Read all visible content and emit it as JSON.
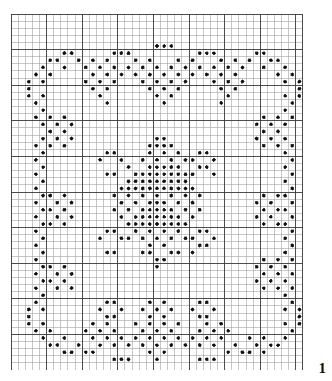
{
  "page": {
    "page_number": "1",
    "background_color": "#ffffff"
  },
  "chart_data": {
    "type": "heatmap",
    "title": "",
    "subtitle": "",
    "xlabel": "",
    "ylabel": "",
    "notation": "filet-crochet-chart",
    "grid": {
      "columns": 41,
      "rows": 50,
      "cell_size_px": 7.12,
      "major_line_every": 5,
      "grid_on": true,
      "minor_line_color": "#9a9a9a",
      "major_line_color": "#3a3a3a",
      "cell_fill_color": "#ffffff",
      "dot_color": "#111111",
      "dot_radius_px": 1.7,
      "dot_outline_color": "#555555"
    },
    "legend": {
      "position": "none",
      "entries": [
        {
          "symbol": "dot",
          "label": "filled block"
        },
        {
          "symbol": "empty",
          "label": "open mesh"
        }
      ]
    },
    "xlim": [
      0,
      41
    ],
    "ylim": [
      0,
      50
    ],
    "x": [
      0,
      1,
      2,
      3,
      4,
      5,
      6,
      7,
      8,
      9,
      10,
      11,
      12,
      13,
      14,
      15,
      16,
      17,
      18,
      19,
      20,
      21,
      22,
      23,
      24,
      25,
      26,
      27,
      28,
      29,
      30,
      31,
      32,
      33,
      34,
      35,
      36,
      37,
      38,
      39,
      40
    ],
    "filled_cells": [
      [
        20,
        4
      ],
      [
        21,
        4
      ],
      [
        22,
        4
      ],
      [
        14,
        5
      ],
      [
        15,
        5
      ],
      [
        16,
        5
      ],
      [
        26,
        5
      ],
      [
        27,
        5
      ],
      [
        28,
        5
      ],
      [
        7,
        5
      ],
      [
        8,
        5
      ],
      [
        34,
        5
      ],
      [
        35,
        5
      ],
      [
        5,
        6
      ],
      [
        6,
        6
      ],
      [
        9,
        6
      ],
      [
        11,
        6
      ],
      [
        13,
        6
      ],
      [
        17,
        6
      ],
      [
        19,
        6
      ],
      [
        23,
        6
      ],
      [
        25,
        6
      ],
      [
        29,
        6
      ],
      [
        31,
        6
      ],
      [
        33,
        6
      ],
      [
        36,
        6
      ],
      [
        37,
        6
      ],
      [
        4,
        7
      ],
      [
        7,
        7
      ],
      [
        10,
        7
      ],
      [
        12,
        7
      ],
      [
        14,
        7
      ],
      [
        16,
        7
      ],
      [
        18,
        7
      ],
      [
        20,
        7
      ],
      [
        22,
        7
      ],
      [
        24,
        7
      ],
      [
        26,
        7
      ],
      [
        28,
        7
      ],
      [
        30,
        7
      ],
      [
        32,
        7
      ],
      [
        35,
        7
      ],
      [
        38,
        7
      ],
      [
        3,
        8
      ],
      [
        5,
        8
      ],
      [
        11,
        8
      ],
      [
        13,
        8
      ],
      [
        15,
        8
      ],
      [
        17,
        8
      ],
      [
        19,
        8
      ],
      [
        21,
        8
      ],
      [
        23,
        8
      ],
      [
        25,
        8
      ],
      [
        27,
        8
      ],
      [
        29,
        8
      ],
      [
        31,
        8
      ],
      [
        37,
        8
      ],
      [
        39,
        8
      ],
      [
        2,
        9
      ],
      [
        4,
        9
      ],
      [
        10,
        9
      ],
      [
        12,
        9
      ],
      [
        14,
        9
      ],
      [
        18,
        9
      ],
      [
        20,
        9
      ],
      [
        22,
        9
      ],
      [
        24,
        9
      ],
      [
        28,
        9
      ],
      [
        30,
        9
      ],
      [
        32,
        9
      ],
      [
        38,
        9
      ],
      [
        40,
        9
      ],
      [
        2,
        10
      ],
      [
        11,
        10
      ],
      [
        13,
        10
      ],
      [
        19,
        10
      ],
      [
        21,
        10
      ],
      [
        23,
        10
      ],
      [
        29,
        10
      ],
      [
        31,
        10
      ],
      [
        40,
        10
      ],
      [
        2,
        11
      ],
      [
        4,
        11
      ],
      [
        12,
        11
      ],
      [
        20,
        11
      ],
      [
        22,
        11
      ],
      [
        30,
        11
      ],
      [
        38,
        11
      ],
      [
        40,
        11
      ],
      [
        3,
        12
      ],
      [
        13,
        12
      ],
      [
        21,
        12
      ],
      [
        29,
        12
      ],
      [
        39,
        12
      ],
      [
        4,
        13
      ],
      [
        38,
        13
      ],
      [
        3,
        14
      ],
      [
        5,
        14
      ],
      [
        7,
        14
      ],
      [
        35,
        14
      ],
      [
        37,
        14
      ],
      [
        39,
        14
      ],
      [
        4,
        15
      ],
      [
        6,
        15
      ],
      [
        8,
        15
      ],
      [
        34,
        15
      ],
      [
        36,
        15
      ],
      [
        38,
        15
      ],
      [
        5,
        16
      ],
      [
        7,
        16
      ],
      [
        35,
        16
      ],
      [
        37,
        16
      ],
      [
        4,
        17
      ],
      [
        6,
        17
      ],
      [
        8,
        17
      ],
      [
        20,
        17
      ],
      [
        21,
        17
      ],
      [
        34,
        17
      ],
      [
        36,
        17
      ],
      [
        38,
        17
      ],
      [
        3,
        18
      ],
      [
        5,
        18
      ],
      [
        7,
        18
      ],
      [
        19,
        18
      ],
      [
        20,
        18
      ],
      [
        21,
        18
      ],
      [
        22,
        18
      ],
      [
        35,
        18
      ],
      [
        37,
        18
      ],
      [
        39,
        18
      ],
      [
        4,
        19
      ],
      [
        13,
        19
      ],
      [
        14,
        19
      ],
      [
        19,
        19
      ],
      [
        21,
        19
      ],
      [
        23,
        19
      ],
      [
        26,
        19
      ],
      [
        27,
        19
      ],
      [
        38,
        19
      ],
      [
        3,
        20
      ],
      [
        12,
        20
      ],
      [
        15,
        20
      ],
      [
        18,
        20
      ],
      [
        20,
        20
      ],
      [
        22,
        20
      ],
      [
        24,
        20
      ],
      [
        25,
        20
      ],
      [
        28,
        20
      ],
      [
        39,
        20
      ],
      [
        4,
        21
      ],
      [
        16,
        21
      ],
      [
        19,
        21
      ],
      [
        20,
        21
      ],
      [
        21,
        21
      ],
      [
        22,
        21
      ],
      [
        23,
        21
      ],
      [
        26,
        21
      ],
      [
        27,
        21
      ],
      [
        38,
        21
      ],
      [
        3,
        22
      ],
      [
        13,
        22
      ],
      [
        14,
        22
      ],
      [
        17,
        22
      ],
      [
        18,
        22
      ],
      [
        19,
        22
      ],
      [
        20,
        22
      ],
      [
        21,
        22
      ],
      [
        22,
        22
      ],
      [
        23,
        22
      ],
      [
        24,
        22
      ],
      [
        25,
        22
      ],
      [
        28,
        22
      ],
      [
        39,
        22
      ],
      [
        4,
        23
      ],
      [
        16,
        23
      ],
      [
        17,
        23
      ],
      [
        18,
        23
      ],
      [
        19,
        23
      ],
      [
        20,
        23
      ],
      [
        21,
        23
      ],
      [
        22,
        23
      ],
      [
        23,
        23
      ],
      [
        24,
        23
      ],
      [
        38,
        23
      ],
      [
        3,
        24
      ],
      [
        15,
        24
      ],
      [
        16,
        24
      ],
      [
        17,
        24
      ],
      [
        18,
        24
      ],
      [
        19,
        24
      ],
      [
        20,
        24
      ],
      [
        21,
        24
      ],
      [
        22,
        24
      ],
      [
        23,
        24
      ],
      [
        24,
        24
      ],
      [
        25,
        24
      ],
      [
        39,
        24
      ],
      [
        4,
        25
      ],
      [
        5,
        25
      ],
      [
        7,
        25
      ],
      [
        14,
        25
      ],
      [
        16,
        25
      ],
      [
        18,
        25
      ],
      [
        20,
        25
      ],
      [
        22,
        25
      ],
      [
        24,
        25
      ],
      [
        26,
        25
      ],
      [
        35,
        25
      ],
      [
        37,
        25
      ],
      [
        38,
        25
      ],
      [
        3,
        26
      ],
      [
        6,
        26
      ],
      [
        8,
        26
      ],
      [
        15,
        26
      ],
      [
        17,
        26
      ],
      [
        19,
        26
      ],
      [
        20,
        26
      ],
      [
        21,
        26
      ],
      [
        23,
        26
      ],
      [
        25,
        26
      ],
      [
        34,
        26
      ],
      [
        36,
        26
      ],
      [
        39,
        26
      ],
      [
        4,
        27
      ],
      [
        5,
        27
      ],
      [
        7,
        27
      ],
      [
        14,
        27
      ],
      [
        16,
        27
      ],
      [
        18,
        27
      ],
      [
        19,
        27
      ],
      [
        20,
        27
      ],
      [
        21,
        27
      ],
      [
        22,
        27
      ],
      [
        24,
        27
      ],
      [
        26,
        27
      ],
      [
        35,
        27
      ],
      [
        37,
        27
      ],
      [
        38,
        27
      ],
      [
        3,
        28
      ],
      [
        6,
        28
      ],
      [
        8,
        28
      ],
      [
        15,
        28
      ],
      [
        17,
        28
      ],
      [
        18,
        28
      ],
      [
        19,
        28
      ],
      [
        20,
        28
      ],
      [
        21,
        28
      ],
      [
        22,
        28
      ],
      [
        23,
        28
      ],
      [
        25,
        28
      ],
      [
        34,
        28
      ],
      [
        36,
        28
      ],
      [
        39,
        28
      ],
      [
        4,
        29
      ],
      [
        5,
        29
      ],
      [
        7,
        29
      ],
      [
        16,
        29
      ],
      [
        17,
        29
      ],
      [
        18,
        29
      ],
      [
        19,
        29
      ],
      [
        20,
        29
      ],
      [
        21,
        29
      ],
      [
        22,
        29
      ],
      [
        23,
        29
      ],
      [
        24,
        29
      ],
      [
        35,
        29
      ],
      [
        37,
        29
      ],
      [
        38,
        29
      ],
      [
        3,
        30
      ],
      [
        13,
        30
      ],
      [
        14,
        30
      ],
      [
        17,
        30
      ],
      [
        19,
        30
      ],
      [
        21,
        30
      ],
      [
        23,
        30
      ],
      [
        26,
        30
      ],
      [
        27,
        30
      ],
      [
        39,
        30
      ],
      [
        4,
        31
      ],
      [
        12,
        31
      ],
      [
        15,
        31
      ],
      [
        16,
        31
      ],
      [
        18,
        31
      ],
      [
        20,
        31
      ],
      [
        22,
        31
      ],
      [
        24,
        31
      ],
      [
        25,
        31
      ],
      [
        28,
        31
      ],
      [
        38,
        31
      ],
      [
        3,
        32
      ],
      [
        19,
        32
      ],
      [
        21,
        32
      ],
      [
        26,
        32
      ],
      [
        27,
        32
      ],
      [
        39,
        32
      ],
      [
        4,
        33
      ],
      [
        13,
        33
      ],
      [
        14,
        33
      ],
      [
        18,
        33
      ],
      [
        19,
        33
      ],
      [
        22,
        33
      ],
      [
        23,
        33
      ],
      [
        25,
        33
      ],
      [
        38,
        33
      ],
      [
        3,
        34
      ],
      [
        20,
        34
      ],
      [
        21,
        34
      ],
      [
        35,
        34
      ],
      [
        37,
        34
      ],
      [
        39,
        34
      ],
      [
        4,
        35
      ],
      [
        5,
        35
      ],
      [
        7,
        35
      ],
      [
        20,
        35
      ],
      [
        34,
        35
      ],
      [
        36,
        35
      ],
      [
        38,
        35
      ],
      [
        3,
        36
      ],
      [
        6,
        36
      ],
      [
        8,
        36
      ],
      [
        35,
        36
      ],
      [
        37,
        36
      ],
      [
        39,
        36
      ],
      [
        4,
        37
      ],
      [
        5,
        37
      ],
      [
        7,
        37
      ],
      [
        34,
        37
      ],
      [
        36,
        37
      ],
      [
        38,
        37
      ],
      [
        3,
        38
      ],
      [
        6,
        38
      ],
      [
        8,
        38
      ],
      [
        35,
        38
      ],
      [
        37,
        38
      ],
      [
        39,
        38
      ],
      [
        4,
        39
      ],
      [
        38,
        39
      ],
      [
        3,
        40
      ],
      [
        13,
        40
      ],
      [
        14,
        40
      ],
      [
        19,
        40
      ],
      [
        21,
        40
      ],
      [
        26,
        40
      ],
      [
        27,
        40
      ],
      [
        39,
        40
      ],
      [
        2,
        41
      ],
      [
        4,
        41
      ],
      [
        12,
        41
      ],
      [
        15,
        41
      ],
      [
        18,
        41
      ],
      [
        20,
        41
      ],
      [
        22,
        41
      ],
      [
        25,
        41
      ],
      [
        28,
        41
      ],
      [
        38,
        41
      ],
      [
        40,
        41
      ],
      [
        2,
        42
      ],
      [
        13,
        42
      ],
      [
        14,
        42
      ],
      [
        19,
        42
      ],
      [
        21,
        42
      ],
      [
        26,
        42
      ],
      [
        27,
        42
      ],
      [
        40,
        42
      ],
      [
        2,
        43
      ],
      [
        4,
        43
      ],
      [
        11,
        43
      ],
      [
        13,
        43
      ],
      [
        17,
        43
      ],
      [
        19,
        43
      ],
      [
        21,
        43
      ],
      [
        23,
        43
      ],
      [
        27,
        43
      ],
      [
        29,
        43
      ],
      [
        38,
        43
      ],
      [
        40,
        43
      ],
      [
        3,
        44
      ],
      [
        5,
        44
      ],
      [
        10,
        44
      ],
      [
        12,
        44
      ],
      [
        14,
        44
      ],
      [
        18,
        44
      ],
      [
        20,
        44
      ],
      [
        22,
        44
      ],
      [
        26,
        44
      ],
      [
        28,
        44
      ],
      [
        30,
        44
      ],
      [
        39,
        44
      ],
      [
        4,
        45
      ],
      [
        7,
        45
      ],
      [
        11,
        45
      ],
      [
        13,
        45
      ],
      [
        15,
        45
      ],
      [
        17,
        45
      ],
      [
        19,
        45
      ],
      [
        21,
        45
      ],
      [
        23,
        45
      ],
      [
        25,
        45
      ],
      [
        27,
        45
      ],
      [
        29,
        45
      ],
      [
        33,
        45
      ],
      [
        35,
        45
      ],
      [
        38,
        45
      ],
      [
        5,
        46
      ],
      [
        6,
        46
      ],
      [
        9,
        46
      ],
      [
        12,
        46
      ],
      [
        14,
        46
      ],
      [
        16,
        46
      ],
      [
        18,
        46
      ],
      [
        20,
        46
      ],
      [
        22,
        46
      ],
      [
        24,
        46
      ],
      [
        26,
        46
      ],
      [
        28,
        46
      ],
      [
        31,
        46
      ],
      [
        34,
        46
      ],
      [
        36,
        46
      ],
      [
        37,
        46
      ],
      [
        7,
        47
      ],
      [
        8,
        47
      ],
      [
        10,
        47
      ],
      [
        11,
        47
      ],
      [
        19,
        47
      ],
      [
        21,
        47
      ],
      [
        30,
        47
      ],
      [
        32,
        47
      ],
      [
        33,
        47
      ],
      [
        35,
        47
      ],
      [
        20,
        48
      ],
      [
        14,
        48
      ],
      [
        15,
        48
      ],
      [
        16,
        48
      ],
      [
        26,
        48
      ],
      [
        27,
        48
      ],
      [
        28,
        48
      ]
    ]
  }
}
